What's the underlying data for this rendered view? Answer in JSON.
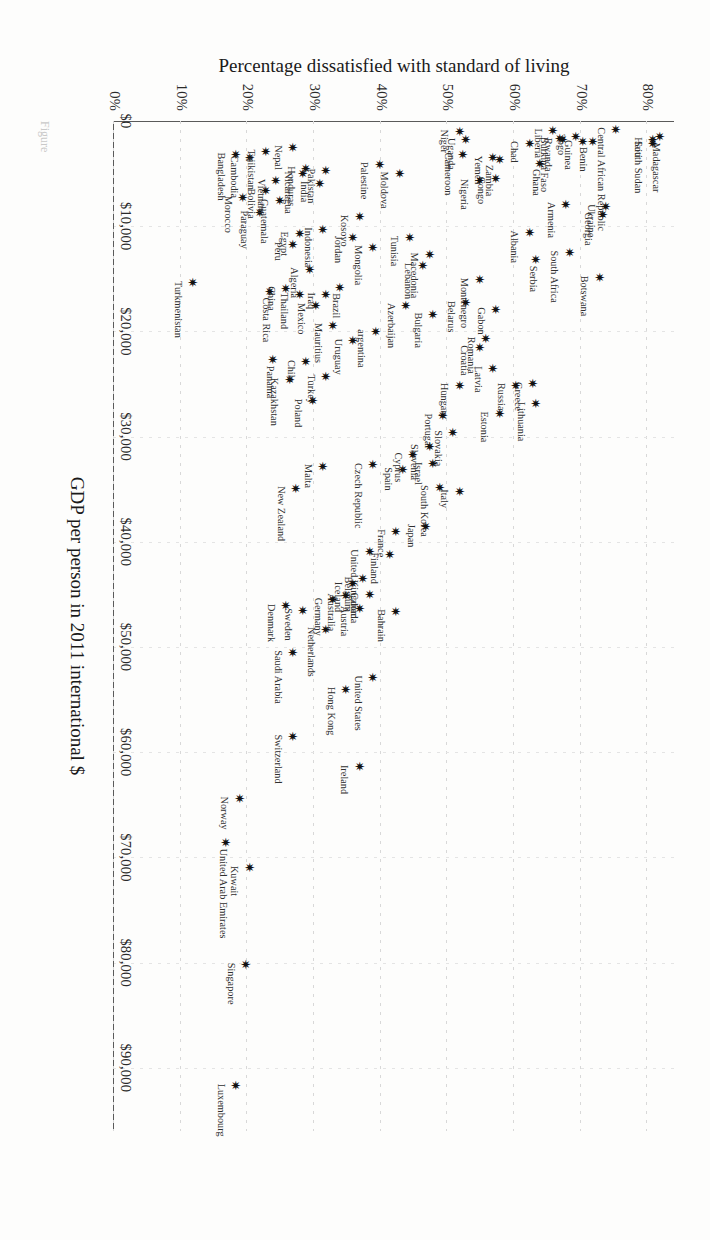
{
  "figure": {
    "caption_fragment": "Figure"
  },
  "chart_data": {
    "type": "scatter",
    "title": "",
    "xlabel": "GDP per person in 2011 international $",
    "ylabel": "Percentage dissatisfied with standard of living",
    "xlim": [
      0,
      96000
    ],
    "ylim": [
      0,
      84
    ],
    "xticks": [
      0,
      10000,
      20000,
      30000,
      40000,
      50000,
      60000,
      70000,
      80000,
      90000
    ],
    "xticklabels": [
      "$0",
      "$10,000",
      "$20,000",
      "$30,000",
      "$40,000",
      "$50,000",
      "$60,000",
      "$70,000",
      "$80,000",
      "$90,000"
    ],
    "yticks": [
      0,
      10,
      20,
      30,
      40,
      50,
      60,
      70,
      80
    ],
    "yticklabels": [
      "0%",
      "10%",
      "20%",
      "30%",
      "40%",
      "50%",
      "60%",
      "70%",
      "80%"
    ],
    "grid": true,
    "legend": "none",
    "marker": "six-pointed-star",
    "point_color": "#111111",
    "points": [
      {
        "name": "Haiti",
        "x": 1650,
        "y": 80.5,
        "pos": "b"
      },
      {
        "name": "Madagascar",
        "x": 1400,
        "y": 81.5,
        "pos": "r"
      },
      {
        "name": "South Sudan",
        "x": 2000,
        "y": 80.5,
        "pos": "b"
      },
      {
        "name": "Central African Republic",
        "x": 700,
        "y": 75.0,
        "pos": "b"
      },
      {
        "name": "Georgia",
        "x": 8800,
        "y": 73.0,
        "pos": "b"
      },
      {
        "name": "Botswana",
        "x": 14800,
        "y": 72.5,
        "pos": "b"
      },
      {
        "name": "Benin",
        "x": 1900,
        "y": 71.5,
        "pos": "rb"
      },
      {
        "name": "Ukraine",
        "x": 8000,
        "y": 73.5,
        "pos": "b"
      },
      {
        "name": "Togo",
        "x": 1350,
        "y": 69.0,
        "pos": "b"
      },
      {
        "name": "Guinea",
        "x": 1900,
        "y": 70.0,
        "pos": "b"
      },
      {
        "name": "Rwanda",
        "x": 1700,
        "y": 67.0,
        "pos": "b"
      },
      {
        "name": "Liberia",
        "x": 800,
        "y": 65.5,
        "pos": "b"
      },
      {
        "name": "Burkina Faso",
        "x": 1600,
        "y": 66.5,
        "pos": "b"
      },
      {
        "name": "Armenia",
        "x": 7800,
        "y": 67.5,
        "pos": "b"
      },
      {
        "name": "South Africa",
        "x": 12400,
        "y": 68.0,
        "pos": "b"
      },
      {
        "name": "Chad",
        "x": 2000,
        "y": 62.0,
        "pos": "b"
      },
      {
        "name": "Ghana",
        "x": 3900,
        "y": 63.5,
        "pos": "r"
      },
      {
        "name": "Albania",
        "x": 10500,
        "y": 62.0,
        "pos": "b"
      },
      {
        "name": "Serbia",
        "x": 13100,
        "y": 63.0,
        "pos": "r"
      },
      {
        "name": "Yemen",
        "x": 3400,
        "y": 56.5,
        "pos": "b"
      },
      {
        "name": "Zambia",
        "x": 3600,
        "y": 57.5,
        "pos": "rb"
      },
      {
        "name": "Congo",
        "x": 5400,
        "y": 57.0,
        "pos": "b"
      },
      {
        "name": "Nigeria",
        "x": 5600,
        "y": 54.5,
        "pos": "b"
      },
      {
        "name": "Cameroon",
        "x": 3100,
        "y": 52.0,
        "pos": "b"
      },
      {
        "name": "Uganda",
        "x": 1700,
        "y": 52.5,
        "pos": "b"
      },
      {
        "name": "Niger",
        "x": 900,
        "y": 51.5,
        "pos": "b"
      },
      {
        "name": "Montenegro",
        "x": 15000,
        "y": 54.5,
        "pos": "b"
      },
      {
        "name": "Gabon",
        "x": 17800,
        "y": 57.0,
        "pos": "b"
      },
      {
        "name": "Greece",
        "x": 24900,
        "y": 62.5,
        "pos": "b"
      },
      {
        "name": "Lithuania",
        "x": 26800,
        "y": 63.0,
        "pos": "b"
      },
      {
        "name": "Russia",
        "x": 25000,
        "y": 60.0,
        "pos": "b"
      },
      {
        "name": "Belarus",
        "x": 17200,
        "y": 52.5,
        "pos": "b"
      },
      {
        "name": "Romania",
        "x": 20600,
        "y": 55.5,
        "pos": "b"
      },
      {
        "name": "Estonia",
        "x": 27700,
        "y": 57.5,
        "pos": "b"
      },
      {
        "name": "Croatia",
        "x": 21400,
        "y": 54.5,
        "pos": "b"
      },
      {
        "name": "Latvia",
        "x": 23400,
        "y": 56.5,
        "pos": "b"
      },
      {
        "name": "Hungary",
        "x": 25000,
        "y": 51.5,
        "pos": "b"
      },
      {
        "name": "Macedonia",
        "x": 12600,
        "y": 47.0,
        "pos": "b"
      },
      {
        "name": "Tunisia",
        "x": 11000,
        "y": 44.0,
        "pos": "b"
      },
      {
        "name": "Lebanon",
        "x": 13600,
        "y": 46.0,
        "pos": "b"
      },
      {
        "name": "Moldova",
        "x": 4900,
        "y": 42.5,
        "pos": "b"
      },
      {
        "name": "Palestine",
        "x": 4000,
        "y": 39.5,
        "pos": "b"
      },
      {
        "name": "Bulgaria",
        "x": 18300,
        "y": 47.5,
        "pos": "b"
      },
      {
        "name": "Azerbaijan",
        "x": 17400,
        "y": 43.5,
        "pos": "b"
      },
      {
        "name": "Portugal",
        "x": 27900,
        "y": 49.0,
        "pos": "b"
      },
      {
        "name": "Slovakia",
        "x": 29500,
        "y": 50.5,
        "pos": "b"
      },
      {
        "name": "Italy",
        "x": 35100,
        "y": 51.5,
        "pos": "b"
      },
      {
        "name": "South Korea",
        "x": 34700,
        "y": 48.5,
        "pos": "b"
      },
      {
        "name": "Slovenia",
        "x": 30800,
        "y": 47.0,
        "pos": "b"
      },
      {
        "name": "Israel",
        "x": 32500,
        "y": 47.5,
        "pos": "b"
      },
      {
        "name": "Japan",
        "x": 38400,
        "y": 46.5,
        "pos": "b"
      },
      {
        "name": "Mongolia",
        "x": 11900,
        "y": 38.5,
        "pos": "b"
      },
      {
        "name": "Kosovo",
        "x": 9000,
        "y": 36.5,
        "pos": "b"
      },
      {
        "name": "Jordan",
        "x": 11000,
        "y": 35.5,
        "pos": "b"
      },
      {
        "name": "argentina",
        "x": 19900,
        "y": 39.0,
        "pos": "b"
      },
      {
        "name": "Uruguay",
        "x": 20800,
        "y": 35.5,
        "pos": "b"
      },
      {
        "name": "Brazil",
        "x": 15700,
        "y": 33.5,
        "pos": "r"
      },
      {
        "name": "Iraq",
        "x": 16400,
        "y": 31.5,
        "pos": "b"
      },
      {
        "name": "Mauritius",
        "x": 19300,
        "y": 32.5,
        "pos": "b"
      },
      {
        "name": "Mexico",
        "x": 17400,
        "y": 30.0,
        "pos": "b"
      },
      {
        "name": "Turkey",
        "x": 24200,
        "y": 31.5,
        "pos": "b"
      },
      {
        "name": "Chile",
        "x": 22800,
        "y": 28.5,
        "pos": "b"
      },
      {
        "name": "Poland",
        "x": 26500,
        "y": 29.5,
        "pos": "b"
      },
      {
        "name": "Kazakhstan",
        "x": 24500,
        "y": 26.0,
        "pos": "b"
      },
      {
        "name": "Algeria",
        "x": 14000,
        "y": 29.0,
        "pos": "b"
      },
      {
        "name": "Thailand",
        "x": 16400,
        "y": 27.5,
        "pos": "b"
      },
      {
        "name": "China",
        "x": 15800,
        "y": 25.5,
        "pos": "b"
      },
      {
        "name": "Costa Rica",
        "x": 16100,
        "y": 23.0,
        "pos": "r"
      },
      {
        "name": "Panama",
        "x": 22600,
        "y": 23.5,
        "pos": "r"
      },
      {
        "name": "Cyprus",
        "x": 31600,
        "y": 44.5,
        "pos": "b"
      },
      {
        "name": "Spain",
        "x": 33000,
        "y": 43.0,
        "pos": "b"
      },
      {
        "name": "France",
        "x": 38900,
        "y": 42.0,
        "pos": "b"
      },
      {
        "name": "Finland",
        "x": 41100,
        "y": 41.0,
        "pos": "b"
      },
      {
        "name": "Bahrain",
        "x": 46500,
        "y": 42.0,
        "pos": "b"
      },
      {
        "name": "Czech Republic",
        "x": 32600,
        "y": 38.5,
        "pos": "b"
      },
      {
        "name": "United Kingdom",
        "x": 40800,
        "y": 38.0,
        "pos": "b"
      },
      {
        "name": "Belgium",
        "x": 43400,
        "y": 37.0,
        "pos": "b"
      },
      {
        "name": "Canada",
        "x": 44900,
        "y": 38.0,
        "pos": "b"
      },
      {
        "name": "Iceland",
        "x": 43900,
        "y": 35.5,
        "pos": "b"
      },
      {
        "name": "Austria",
        "x": 46200,
        "y": 36.5,
        "pos": "b"
      },
      {
        "name": "Australia",
        "x": 45000,
        "y": 34.5,
        "pos": "b"
      },
      {
        "name": "Germany",
        "x": 45400,
        "y": 32.5,
        "pos": "b"
      },
      {
        "name": "Netherlands",
        "x": 48200,
        "y": 31.5,
        "pos": "b"
      },
      {
        "name": "Sweden",
        "x": 46400,
        "y": 28.0,
        "pos": "b"
      },
      {
        "name": "Denmark",
        "x": 46000,
        "y": 25.5,
        "pos": "b"
      },
      {
        "name": "Malta",
        "x": 32700,
        "y": 31.0,
        "pos": "b"
      },
      {
        "name": "New Zealand",
        "x": 34800,
        "y": 27.0,
        "pos": "b"
      },
      {
        "name": "United States",
        "x": 52800,
        "y": 38.5,
        "pos": "b"
      },
      {
        "name": "Hong Kong",
        "x": 53900,
        "y": 34.5,
        "pos": "b"
      },
      {
        "name": "Ireland",
        "x": 61300,
        "y": 36.5,
        "pos": "b"
      },
      {
        "name": "Saudi Arabia",
        "x": 50400,
        "y": 26.5,
        "pos": "b"
      },
      {
        "name": "Switzerland",
        "x": 58400,
        "y": 26.5,
        "pos": "b"
      },
      {
        "name": "Norway",
        "x": 64300,
        "y": 18.5,
        "pos": "b"
      },
      {
        "name": "United Arab Emirates",
        "x": 68500,
        "y": 16.5,
        "pos": "r"
      },
      {
        "name": "Kuwait",
        "x": 70900,
        "y": 20.0,
        "pos": "b"
      },
      {
        "name": "Singapore",
        "x": 80100,
        "y": 19.5,
        "pos": "b"
      },
      {
        "name": "Luxembourg",
        "x": 91600,
        "y": 18.0,
        "pos": "b"
      },
      {
        "name": "Turkmenistan",
        "x": 15300,
        "y": 11.5,
        "pos": "b"
      },
      {
        "name": "Paraguay",
        "x": 8600,
        "y": 21.5,
        "pos": "b"
      },
      {
        "name": "Morocco",
        "x": 7200,
        "y": 19.0,
        "pos": "b"
      },
      {
        "name": "Guatemala",
        "x": 7500,
        "y": 24.5,
        "pos": "b"
      },
      {
        "name": "Bolivia",
        "x": 6500,
        "y": 22.5,
        "pos": "b"
      },
      {
        "name": "Cambodia",
        "x": 3400,
        "y": 20.0,
        "pos": "b"
      },
      {
        "name": "Bangladesh",
        "x": 3100,
        "y": 18.0,
        "pos": "b"
      },
      {
        "name": "Tajikistan",
        "x": 2800,
        "y": 22.5,
        "pos": "b"
      },
      {
        "name": "Vietnam",
        "x": 5600,
        "y": 24.0,
        "pos": "b"
      },
      {
        "name": "Peru",
        "x": 11600,
        "y": 26.5,
        "pos": "b"
      },
      {
        "name": "Egypt",
        "x": 10600,
        "y": 27.5,
        "pos": "b"
      },
      {
        "name": "Indonesia",
        "x": 10200,
        "y": 31.0,
        "pos": "b"
      },
      {
        "name": "Nicaragua",
        "x": 4900,
        "y": 28.0,
        "pos": "b"
      },
      {
        "name": "India",
        "x": 5800,
        "y": 30.5,
        "pos": "b"
      },
      {
        "name": "Honduras",
        "x": 4400,
        "y": 28.5,
        "pos": "b"
      },
      {
        "name": "Pakistan",
        "x": 4600,
        "y": 31.5,
        "pos": "b"
      },
      {
        "name": "Nepal",
        "x": 2400,
        "y": 26.5,
        "pos": "b"
      }
    ]
  }
}
